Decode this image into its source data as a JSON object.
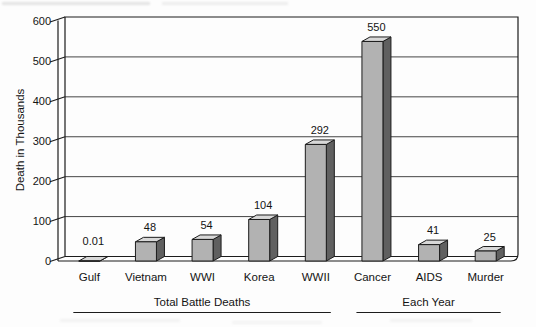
{
  "chart_data": {
    "type": "bar",
    "style": "3d-column",
    "title": "",
    "ylabel": "Death in Thousands",
    "xlabel": "",
    "ylim": [
      0,
      600
    ],
    "ytick_interval": 100,
    "yticks": [
      "0",
      "100",
      "200",
      "300",
      "400",
      "500",
      "600"
    ],
    "grid": "horizontal",
    "legend": "none",
    "categories": [
      "Gulf",
      "Vietnam",
      "WWI",
      "Korea",
      "WWII",
      "Cancer",
      "AIDS",
      "Murder"
    ],
    "values": [
      0.01,
      48,
      54,
      104,
      292,
      550,
      41,
      25
    ],
    "value_labels": [
      "0.01",
      "48",
      "54",
      "104",
      "292",
      "550",
      "41",
      "25"
    ],
    "groups": [
      {
        "label": "Total Battle Deaths",
        "start_index": 0,
        "end_index": 4
      },
      {
        "label": "Each Year",
        "start_index": 5,
        "end_index": 7
      }
    ],
    "colors": {
      "background": "#fdfdfd",
      "bar_front": "#b2b2b2",
      "bar_top": "#d8d8d8",
      "bar_side": "#606060",
      "outline": "#1c1c1c",
      "gridline": "#454545",
      "text": "#141414"
    }
  }
}
